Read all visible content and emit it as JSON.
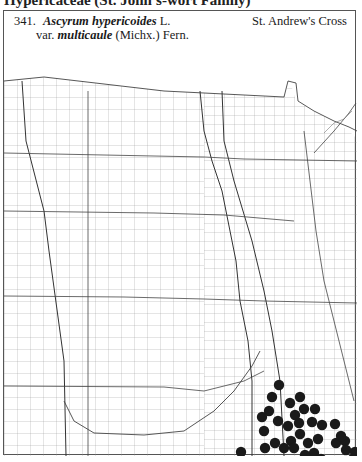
{
  "page": {
    "header": "Hypericaceae (St. John's-wort Family)"
  },
  "species": {
    "number": "341.",
    "genus": "Ascyrum",
    "epithet": "hypericoides",
    "author": "L.",
    "var_prefix": "var.",
    "variety": "multicaule",
    "var_author": "(Michx.) Fern.",
    "common_name": "St. Andrew's Cross"
  },
  "map": {
    "region": "Great Plains counties",
    "dot_color": "#1a1a1a",
    "line_color": "#555555",
    "dots": [
      [
        278,
        84
      ],
      [
        271,
        96
      ],
      [
        289,
        102
      ],
      [
        299,
        96
      ],
      [
        294,
        114
      ],
      [
        303,
        108
      ],
      [
        314,
        108
      ],
      [
        268,
        110
      ],
      [
        277,
        120
      ],
      [
        287,
        125
      ],
      [
        298,
        122
      ],
      [
        311,
        121
      ],
      [
        321,
        124
      ],
      [
        334,
        123
      ],
      [
        261,
        116
      ],
      [
        263,
        130
      ],
      [
        274,
        142
      ],
      [
        290,
        140
      ],
      [
        299,
        133
      ],
      [
        307,
        142
      ],
      [
        317,
        138
      ],
      [
        335,
        142
      ],
      [
        344,
        140
      ],
      [
        264,
        147
      ],
      [
        283,
        147
      ],
      [
        293,
        147
      ],
      [
        313,
        152
      ],
      [
        320,
        158
      ],
      [
        340,
        135
      ],
      [
        345,
        149
      ],
      [
        367,
        134
      ],
      [
        258,
        161
      ],
      [
        276,
        168
      ],
      [
        262,
        180
      ],
      [
        304,
        154
      ],
      [
        300,
        182
      ],
      [
        330,
        168
      ],
      [
        314,
        189
      ],
      [
        322,
        199
      ],
      [
        330,
        217
      ],
      [
        354,
        151
      ],
      [
        352,
        158
      ],
      [
        305,
        214
      ],
      [
        293,
        209
      ],
      [
        298,
        231
      ],
      [
        312,
        204
      ],
      [
        320,
        229
      ],
      [
        332,
        257
      ],
      [
        240,
        151
      ],
      [
        234,
        163
      ],
      [
        244,
        184
      ],
      [
        231,
        196
      ],
      [
        228,
        222
      ],
      [
        212,
        222
      ],
      [
        205,
        197
      ],
      [
        215,
        175
      ],
      [
        254,
        164
      ],
      [
        247,
        208
      ],
      [
        260,
        221
      ],
      [
        229,
        233
      ],
      [
        240,
        248
      ],
      [
        214,
        248
      ],
      [
        202,
        230
      ],
      [
        197,
        236
      ],
      [
        197,
        257
      ],
      [
        208,
        256
      ],
      [
        229,
        256
      ],
      [
        254,
        223
      ],
      [
        301,
        240
      ],
      [
        282,
        264
      ]
    ]
  }
}
